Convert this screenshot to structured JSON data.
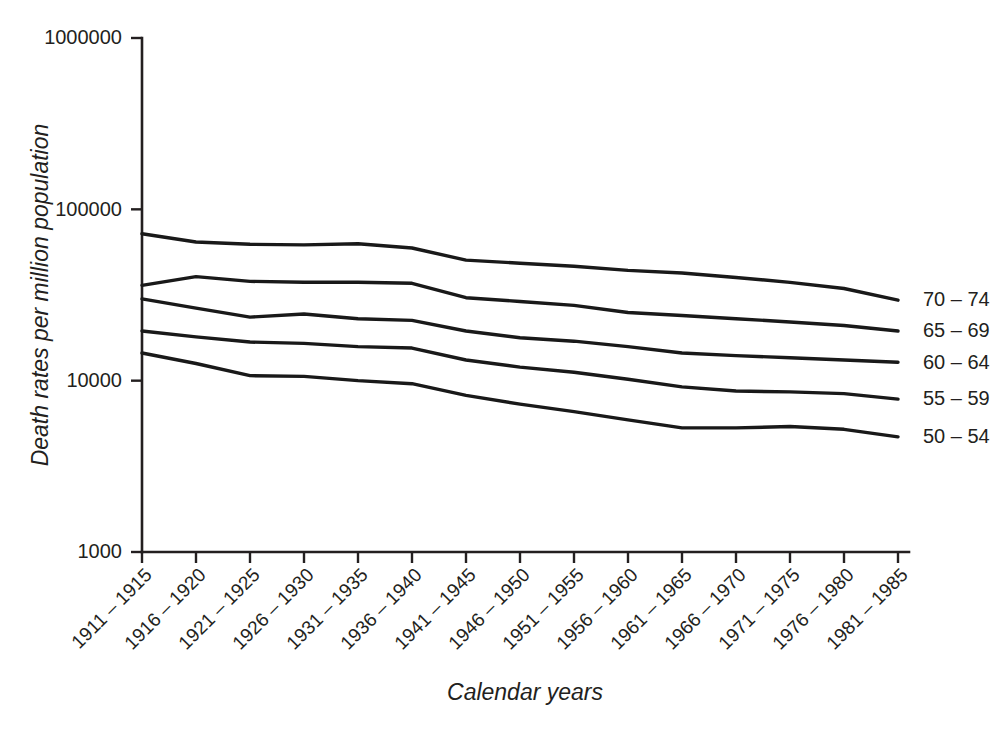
{
  "chart_data": {
    "type": "line",
    "title": "",
    "xlabel": "Calendar years",
    "ylabel": "Death rates per million population",
    "yscale": "log",
    "ylim": [
      1000,
      1000000
    ],
    "ytick_labels": [
      "1000000",
      "100000",
      "10000",
      "1000"
    ],
    "ytick_values": [
      1000000,
      100000,
      10000,
      1000
    ],
    "grid": false,
    "legend_position": "right-of-axis-inline",
    "categories": [
      "1911 – 1915",
      "1916 – 1920",
      "1921 – 1925",
      "1926 – 1930",
      "1931 – 1935",
      "1936 – 1940",
      "1941 – 1945",
      "1946 – 1950",
      "1951 – 1955",
      "1956 – 1960",
      "1961 – 1965",
      "1966 – 1970",
      "1971 – 1975",
      "1976 – 1980",
      "1981 – 1985"
    ],
    "series": [
      {
        "name": "70 – 74",
        "label": "70 – 74",
        "values": [
          72000,
          64500,
          62500,
          62000,
          63000,
          59500,
          50500,
          48500,
          46500,
          44000,
          42500,
          40000,
          37500,
          34500,
          29500
        ]
      },
      {
        "name": "65 – 69",
        "label": "65 – 69",
        "values": [
          36000,
          40500,
          38000,
          37500,
          37500,
          37000,
          30500,
          29000,
          27500,
          25000,
          24000,
          23000,
          22000,
          21000,
          19500
        ]
      },
      {
        "name": "60 – 64",
        "label": "60 – 64",
        "values": [
          30000,
          26500,
          23500,
          24500,
          23000,
          22500,
          19500,
          17800,
          17000,
          15800,
          14500,
          14000,
          13600,
          13200,
          12800
        ]
      },
      {
        "name": "55 – 59",
        "label": "55 – 59",
        "values": [
          19500,
          18000,
          16800,
          16500,
          15800,
          15500,
          13200,
          12000,
          11200,
          10200,
          9200,
          8700,
          8600,
          8400,
          7800
        ]
      },
      {
        "name": "50 – 54",
        "label": "50 – 54",
        "values": [
          14500,
          12600,
          10700,
          10600,
          10000,
          9600,
          8200,
          7300,
          6600,
          5900,
          5300,
          5300,
          5400,
          5200,
          4700
        ]
      }
    ]
  },
  "axis": {
    "y_title": "Death rates per million population",
    "x_title": "Calendar years"
  }
}
